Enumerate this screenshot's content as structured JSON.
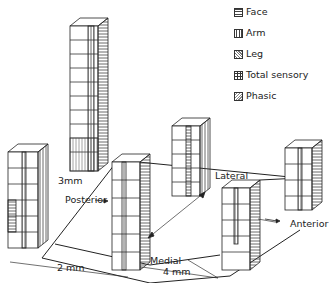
{
  "legend": {
    "items": [
      {
        "label": "Face",
        "pattern": "horizontal-hatch"
      },
      {
        "label": "Arm",
        "pattern": "vertical-hatch"
      },
      {
        "label": "Leg",
        "pattern": "fine-diagonal-hatch"
      },
      {
        "label": "Total sensory",
        "pattern": "cross-hatch"
      },
      {
        "label": "Phasic",
        "pattern": "stipple"
      }
    ]
  },
  "axes": {
    "dim_3mm": "3mm",
    "dim_2mm": "2 mm",
    "dim_4mm": "4 mm",
    "posterior": "Posterior",
    "anterior": "Anterior",
    "lateral": "Lateral",
    "medial": "Medial"
  },
  "columns": [
    {
      "position": "far-left-front",
      "blocks": 6
    },
    {
      "position": "tall-back-left",
      "blocks": 14
    },
    {
      "position": "center-front",
      "blocks": 6
    },
    {
      "position": "center-back",
      "blocks": 5
    },
    {
      "position": "right-front",
      "blocks": 5
    },
    {
      "position": "right-back",
      "blocks": 4
    }
  ]
}
